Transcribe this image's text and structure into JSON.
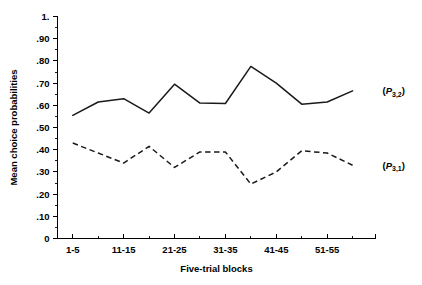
{
  "chart_data": {
    "type": "line",
    "title": "",
    "xlabel": "Five-trial blocks",
    "ylabel": "Mean choice probabilities",
    "categories": [
      "1-5",
      "6-10",
      "11-15",
      "16-20",
      "21-25",
      "26-30",
      "31-35",
      "36-40",
      "41-45",
      "46-50",
      "51-55",
      "56-60"
    ],
    "xtick_labels_shown": [
      "1-5",
      "11-15",
      "21-25",
      "31-35",
      "41-45",
      "51-55"
    ],
    "ytick_labels": [
      "0",
      ".10",
      ".20",
      ".30",
      ".40",
      ".50",
      ".60",
      ".70",
      ".80",
      ".90",
      "1."
    ],
    "ylim": [
      0,
      1.0
    ],
    "ytick_step": 0.1,
    "yminor_step": 0.05,
    "grid": false,
    "legend_position": "right-inline",
    "series": [
      {
        "name": "(P3,2)",
        "label_main": "P",
        "label_sub": "3,2",
        "style": "solid",
        "color": "#1a1a1a",
        "values": [
          0.555,
          0.615,
          0.63,
          0.565,
          0.695,
          0.61,
          0.608,
          0.775,
          0.7,
          0.605,
          0.615,
          0.665
        ]
      },
      {
        "name": "(P3,1)",
        "label_main": "P",
        "label_sub": "3,1",
        "style": "dashed",
        "color": "#1a1a1a",
        "values": [
          0.43,
          0.385,
          0.34,
          0.415,
          0.32,
          0.39,
          0.39,
          0.245,
          0.3,
          0.395,
          0.385,
          0.33
        ]
      }
    ]
  },
  "axis": {
    "y_title": "Mean choice probabilities",
    "x_title": "Five-trial blocks"
  },
  "legend": {
    "solid_open": "(",
    "solid_p": "P",
    "solid_sub": "3,2",
    "solid_close": ")",
    "dashed_open": "(",
    "dashed_p": "P",
    "dashed_sub": "3,1",
    "dashed_close": ")"
  }
}
